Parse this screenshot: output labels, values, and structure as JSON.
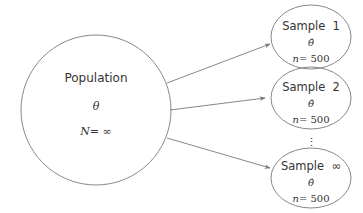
{
  "population": {
    "label": "Population",
    "parameter": "θ",
    "size_label": "N",
    "size_eq": "= ∞"
  },
  "samples": [
    {
      "label": "Sample  1",
      "estimator": "θ̂",
      "n_label": "n",
      "n_eq": "= 500"
    },
    {
      "label": "Sample  2",
      "estimator": "θ̂",
      "n_label": "n",
      "n_eq": "= 500"
    },
    {
      "label": "Sample  ∞",
      "estimator": "θ̂",
      "n_label": "n",
      "n_eq": "= 500"
    }
  ],
  "ellipsis": "⋮",
  "colors": {
    "stroke": "#888888",
    "text": "#333333"
  }
}
